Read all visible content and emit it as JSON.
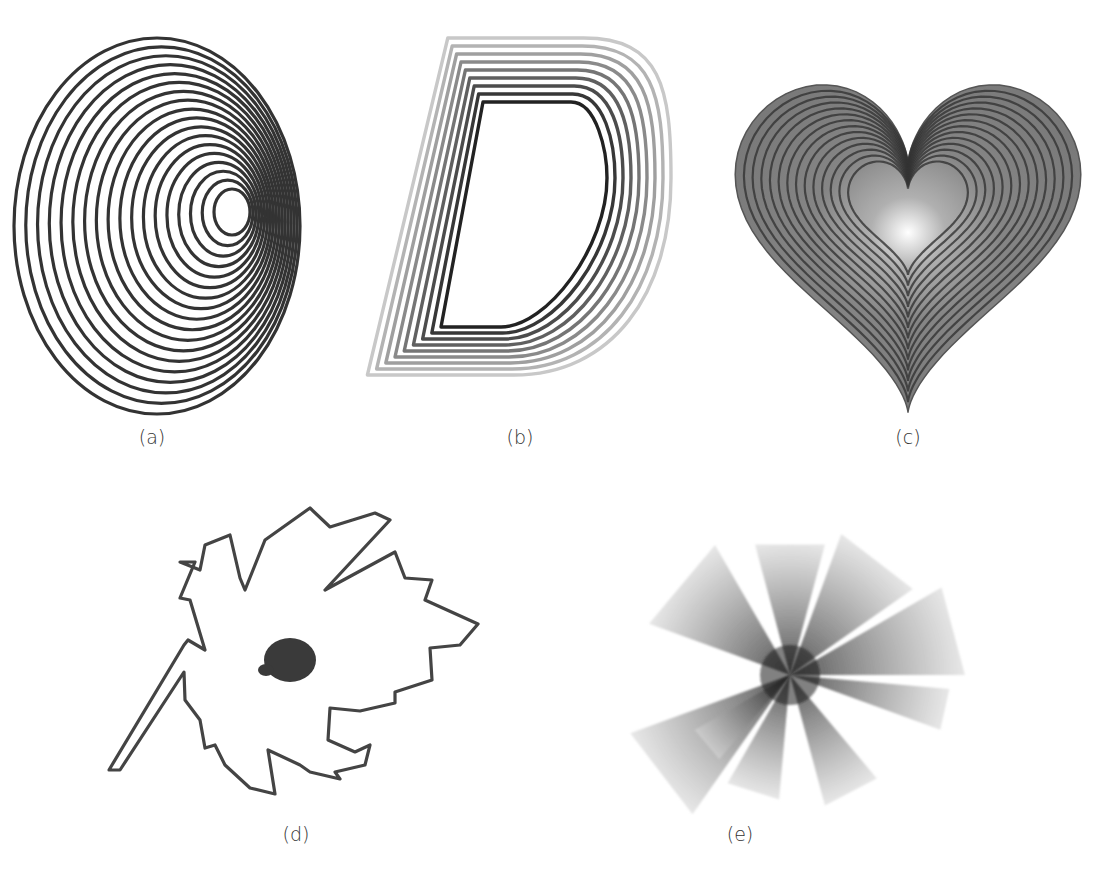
{
  "figure": {
    "panels": [
      {
        "id": "a",
        "caption": "(a)",
        "description": "Concentric off-center elliptical contour rings",
        "ring_count": 18,
        "stroke_color": "#333333"
      },
      {
        "id": "b",
        "caption": "(b)",
        "description": "Letter D with nested offset outlines fading outward",
        "letter": "D",
        "outline_count": 9,
        "inner_color": "#222222",
        "outer_color": "#c8c8c8"
      },
      {
        "id": "c",
        "caption": "(c)",
        "description": "Heart shape with nested contour lines and radial gradient fill",
        "contour_count": 14,
        "fill_color": "#7a7a7a",
        "center_color": "#ffffff",
        "line_color": "#333333"
      },
      {
        "id": "d",
        "caption": "(d)",
        "description": "Leaf outline with dark blob at center",
        "outline_color": "#444444",
        "blob_color": "#3a3a3a"
      },
      {
        "id": "e",
        "caption": "(e)",
        "description": "Radial star-burst of overlapping gradient wedges",
        "wedge_count": 9,
        "core_color": "#1a1a1a"
      }
    ]
  }
}
